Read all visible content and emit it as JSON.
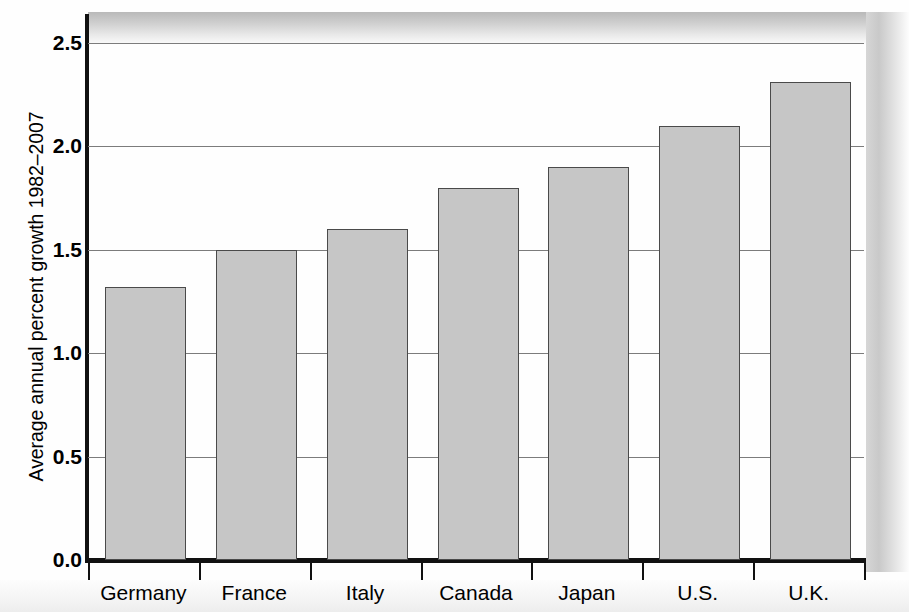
{
  "chart_data": {
    "type": "bar",
    "title": "",
    "subtitle": "",
    "xlabel": "",
    "ylabel": "Average annual percent growth 1982–2007",
    "categories": [
      "Germany",
      "France",
      "Italy",
      "Canada",
      "Japan",
      "U.S.",
      "U.K."
    ],
    "values": [
      1.32,
      1.5,
      1.6,
      1.8,
      1.9,
      2.1,
      2.31
    ],
    "series": [
      {
        "name": "Average annual percent growth 1982–2007",
        "values": [
          1.32,
          1.5,
          1.6,
          1.8,
          1.9,
          2.1,
          2.31
        ]
      }
    ],
    "ylim": [
      0.0,
      2.5
    ],
    "y_ticks": [
      0.0,
      0.5,
      1.0,
      1.5,
      2.0,
      2.5
    ],
    "y_tick_labels": [
      "0.0",
      "0.5",
      "1.0",
      "1.5",
      "2.0",
      "2.5"
    ],
    "grid": "horizontal",
    "legend": "none",
    "bar_color": "#c6c6c6",
    "bar_edge_color": "#4a4a4a",
    "gridline_color": "#7c7c7c",
    "axis_color": "#111111",
    "background_color": "#ffffff"
  },
  "axes": {
    "y_title": "Average annual percent growth 1982–2007",
    "y_tick_labels": [
      "2.5",
      "2.0",
      "1.5",
      "1.0",
      "0.5",
      "0.0"
    ],
    "x_tick_labels": [
      "Germany",
      "France",
      "Italy",
      "Canada",
      "Japan",
      "U.S.",
      "U.K."
    ]
  }
}
